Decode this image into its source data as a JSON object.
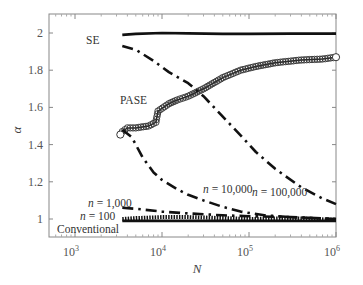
{
  "chart_data": {
    "type": "line",
    "title": "",
    "xlabel": "N",
    "ylabel": "α",
    "xscale": "log",
    "xlim": [
      500,
      1000000
    ],
    "ylim": [
      0.92,
      2.1
    ],
    "grid": false,
    "legend": "none (inline annotations)",
    "x_ticks": [
      {
        "value": 1000,
        "base": "10",
        "exp": "3"
      },
      {
        "value": 10000,
        "base": "10",
        "exp": "4"
      },
      {
        "value": 100000,
        "base": "10",
        "exp": "5"
      },
      {
        "value": 1000000,
        "base": "10",
        "exp": "6"
      }
    ],
    "y_ticks": [
      "1",
      "1.2",
      "1.4",
      "1.6",
      "1.8",
      "2"
    ],
    "y_tick_values": [
      1,
      1.2,
      1.4,
      1.6,
      1.8,
      2
    ],
    "series": [
      {
        "name": "SE",
        "style": "solid",
        "x": [
          3500,
          5000,
          10000,
          20000,
          50000,
          100000,
          300000,
          1000000
        ],
        "values": [
          1.99,
          1.995,
          2.0,
          1.998,
          1.995,
          1.995,
          1.997,
          1.997
        ]
      },
      {
        "name": "PASE",
        "style": "circles",
        "x": [
          3500,
          4000,
          5000,
          7000,
          8500,
          9000,
          12000,
          15000,
          20000,
          30000,
          50000,
          80000,
          120000,
          200000,
          400000,
          700000,
          1000000
        ],
        "values": [
          1.47,
          1.49,
          1.49,
          1.5,
          1.52,
          1.58,
          1.62,
          1.64,
          1.66,
          1.7,
          1.76,
          1.8,
          1.82,
          1.84,
          1.855,
          1.86,
          1.87
        ]
      },
      {
        "name": "n = 100,000",
        "style": "dash-dot",
        "x": [
          3500,
          5000,
          8000,
          12000,
          20000,
          30000,
          50000,
          80000,
          120000,
          200000,
          400000,
          700000,
          1000000
        ],
        "values": [
          1.93,
          1.91,
          1.85,
          1.79,
          1.73,
          1.66,
          1.55,
          1.45,
          1.36,
          1.27,
          1.17,
          1.11,
          1.08
        ]
      },
      {
        "name": "n = 10,000",
        "style": "dash-dot",
        "x": [
          3500,
          4500,
          6000,
          8000,
          10000,
          15000,
          20000,
          30000,
          50000,
          80000,
          150000,
          300000,
          1000000
        ],
        "values": [
          1.48,
          1.44,
          1.33,
          1.25,
          1.21,
          1.16,
          1.13,
          1.1,
          1.065,
          1.04,
          1.02,
          1.01,
          1.0
        ]
      },
      {
        "name": "n = 1,000",
        "style": "dash-dot",
        "x": [
          3500,
          5000,
          10000,
          20000,
          50000,
          100000,
          300000,
          1000000
        ],
        "values": [
          1.06,
          1.055,
          1.04,
          1.03,
          1.02,
          1.015,
          1.01,
          1.0
        ]
      },
      {
        "name": "n = 100",
        "style": "dotted-thick",
        "x": [
          3500,
          5000,
          10000,
          20000,
          50000,
          100000,
          300000,
          1000000
        ],
        "values": [
          1.0,
          1.005,
          1.01,
          1.01,
          1.005,
          1.0,
          1.005,
          0.995
        ]
      },
      {
        "name": "Conventional",
        "style": "solid",
        "x": [
          3500,
          10000,
          100000,
          1000000
        ],
        "values": [
          0.99,
          0.99,
          0.99,
          0.99
        ]
      }
    ],
    "annotations": [
      {
        "text": "SE",
        "x_px": 86,
        "y_px": 44
      },
      {
        "text": "PASE",
        "x_px": 120,
        "y_px": 104
      },
      {
        "text": "n = 100,000",
        "x_px": 252,
        "y_px": 196
      },
      {
        "text": "n = 10,000",
        "x_px": 203,
        "y_px": 193
      },
      {
        "text": "n = 1,000",
        "x_px": 88,
        "y_px": 207
      },
      {
        "text": "n = 100",
        "x_px": 80,
        "y_px": 220
      },
      {
        "text": "Conventional",
        "x_px": 57,
        "y_px": 232
      }
    ]
  },
  "labels": {
    "x_axis": "N",
    "y_axis": "α",
    "se": "SE",
    "pase": "PASE",
    "n100000_prefix": "n",
    "n100000_value": " = 100,000",
    "n10000_prefix": "n",
    "n10000_value": " = 10,000",
    "n1000_prefix": "n",
    "n1000_value": " = 1,000",
    "n100_prefix": "n",
    "n100_value": " = 100",
    "conventional": "Conventional"
  }
}
